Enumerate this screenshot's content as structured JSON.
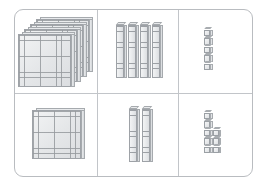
{
  "board": {
    "border_color": "#b9bcc0",
    "divider_color": "#c2c5c9",
    "block_fill": "#e7e9eb",
    "block_line": "#9ba0a5",
    "background": "#ffffff"
  },
  "grid": {
    "rows": 2,
    "columns": 3,
    "column_labels": [
      "hundreds",
      "tens",
      "ones"
    ]
  },
  "cells": [
    {
      "id": "row1-hundreds",
      "row": 1,
      "column": "hundreds",
      "block_type": "flat",
      "count": 4,
      "unit_value": 100,
      "value": 400,
      "label": "4 hundreds"
    },
    {
      "id": "row1-tens",
      "row": 1,
      "column": "tens",
      "block_type": "rod",
      "count": 4,
      "unit_value": 10,
      "value": 40,
      "label": "4 tens"
    },
    {
      "id": "row1-ones",
      "row": 1,
      "column": "ones",
      "block_type": "unit",
      "count": 5,
      "unit_value": 1,
      "value": 5,
      "label": "5 ones"
    },
    {
      "id": "row2-hundreds",
      "row": 2,
      "column": "hundreds",
      "block_type": "flat",
      "count": 1,
      "unit_value": 100,
      "value": 100,
      "label": "1 hundred"
    },
    {
      "id": "row2-tens",
      "row": 2,
      "column": "tens",
      "block_type": "rod",
      "count": 2,
      "unit_value": 10,
      "value": 20,
      "label": "2 tens"
    },
    {
      "id": "row2-ones",
      "row": 2,
      "column": "ones",
      "block_type": "unit",
      "count": 8,
      "unit_value": 1,
      "value": 8,
      "label": "8 ones"
    }
  ],
  "totals": {
    "row1": 445,
    "row2": 128
  }
}
